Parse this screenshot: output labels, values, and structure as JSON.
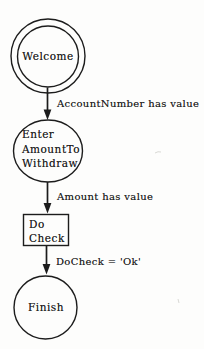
{
  "canvas": {
    "background_color": "#fdfdfc",
    "ink_color": "#1c1c1c",
    "style": "scanned black-and-white statechart"
  },
  "diagram": {
    "type": "statechart-flow",
    "nodes": [
      {
        "id": "welcome",
        "shape": "double-circle",
        "role": "start-state",
        "label": "Welcome"
      },
      {
        "id": "enter-amount-to-withdraw",
        "shape": "circle",
        "role": "state",
        "lines": [
          "Enter",
          "AmountTo",
          "Withdraw"
        ]
      },
      {
        "id": "do-check",
        "shape": "rectangle",
        "role": "action",
        "lines": [
          "Do",
          "Check"
        ]
      },
      {
        "id": "finish",
        "shape": "circle",
        "role": "end-state",
        "label": "Finish"
      }
    ],
    "edges": [
      {
        "from": "welcome",
        "to": "enter-amount-to-withdraw",
        "label": "AccountNumber has value"
      },
      {
        "from": "enter-amount-to-withdraw",
        "to": "do-check",
        "label": "Amount has value"
      },
      {
        "from": "do-check",
        "to": "finish",
        "label": "DoCheck = 'Ok'"
      }
    ]
  }
}
